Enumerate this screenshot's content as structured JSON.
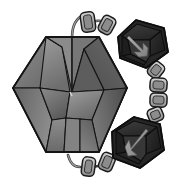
{
  "figure": {
    "background_color": "#ffffff",
    "width": 184,
    "height": 186,
    "style": "grayscale 3d render"
  },
  "palette": {
    "background": "#ffffff",
    "outline": "#1a1a1a",
    "gem_light": "#9a9a9a",
    "gem_mid": "#7d7d7d",
    "gem_dark": "#5e5e5e",
    "gem_darker": "#4a4a4a",
    "cube_dark": "#2e2e2e",
    "cube_darker": "#1f1f1f",
    "cube_face": "#3a3a3a",
    "arrow_gray": "#9c9c9c",
    "link_fill": "#b4b4b4",
    "link_highlight": "#d2d2d2",
    "wire": "#8e8e8e"
  },
  "objects": {
    "gem": {
      "name": "faceted-hexagonal-gem",
      "label": "Gem",
      "center_x": 70,
      "center_y": 94,
      "facet_count": 9,
      "outline_color": "#1a1a1a"
    },
    "cube_top": {
      "name": "arrow-cube-top",
      "label": "Cube A",
      "center_x": 142,
      "center_y": 46,
      "arrow_direction": "down-right",
      "fill": "#2e2e2e"
    },
    "cube_bottom": {
      "name": "arrow-cube-bottom",
      "label": "Cube B",
      "center_x": 136,
      "center_y": 143,
      "arrow_direction": "down-left",
      "fill": "#2e2e2e"
    },
    "chain": {
      "name": "connector-chain",
      "label": "Chain",
      "link_count": 9,
      "fill": "#b4b4b4",
      "links": [
        {
          "cx": 88,
          "cy": 22,
          "w": 13,
          "h": 19,
          "rot": -8
        },
        {
          "cx": 107,
          "cy": 25,
          "w": 13,
          "h": 17,
          "rot": 28
        },
        {
          "cx": 156,
          "cy": 70,
          "w": 13,
          "h": 15,
          "rot": 38
        },
        {
          "cx": 158,
          "cy": 85,
          "w": 16,
          "h": 13,
          "rot": 4
        },
        {
          "cx": 158,
          "cy": 100,
          "w": 16,
          "h": 13,
          "rot": 2
        },
        {
          "cx": 155,
          "cy": 115,
          "w": 14,
          "h": 13,
          "rot": -22
        },
        {
          "cx": 107,
          "cy": 162,
          "w": 13,
          "h": 17,
          "rot": 22
        },
        {
          "cx": 88,
          "cy": 166,
          "w": 12,
          "h": 18,
          "rot": 8
        },
        {
          "cx": 60,
          "cy": 170,
          "w": 11,
          "h": 15,
          "rot": -4
        }
      ]
    },
    "wires": [
      {
        "name": "wire-gem-top-to-chain",
        "from": "gem-top",
        "to": "chain-link-1"
      },
      {
        "name": "wire-gem-bottom-to-chain",
        "from": "gem-bottom",
        "to": "chain-link-9"
      }
    ]
  }
}
